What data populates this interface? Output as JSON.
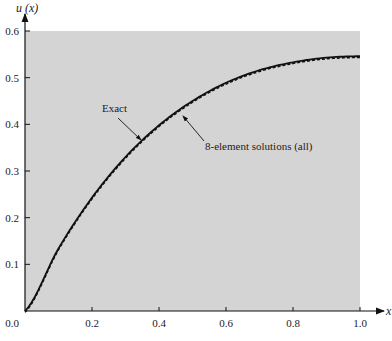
{
  "chart_data": {
    "type": "line",
    "title": "",
    "xlabel": "x",
    "ylabel": "u (x)",
    "xlim": [
      0.0,
      1.0
    ],
    "ylim": [
      0.0,
      0.6
    ],
    "grid": false,
    "background": "#d4d4d4",
    "x_ticks": [
      "0.0",
      "0.2",
      "0.4",
      "0.6",
      "0.8",
      "1.0"
    ],
    "y_ticks": [
      "0.1",
      "0.2",
      "0.3",
      "0.4",
      "0.5",
      "0.6"
    ],
    "x": [
      0.0,
      0.1,
      0.2,
      0.3,
      0.4,
      0.5,
      0.6,
      0.7,
      0.8,
      0.9,
      1.0
    ],
    "series": [
      {
        "name": "Exact",
        "style": "solid",
        "values": [
          0.0,
          0.134,
          0.243,
          0.33,
          0.398,
          0.45,
          0.489,
          0.516,
          0.533,
          0.543,
          0.546
        ]
      },
      {
        "name": "8-element solutions (all)",
        "style": "dashed",
        "values": [
          0.0,
          0.134,
          0.243,
          0.33,
          0.398,
          0.45,
          0.489,
          0.516,
          0.533,
          0.543,
          0.546
        ]
      }
    ],
    "annotations": [
      {
        "text": "Exact",
        "points_to_x": 0.36
      },
      {
        "text": "8-element solutions (all)",
        "points_to_x": 0.46
      }
    ]
  },
  "labels": {
    "ylabel": "u (x)",
    "xlabel": "x",
    "exact": "Exact",
    "fem": "8-element solutions (all)"
  }
}
